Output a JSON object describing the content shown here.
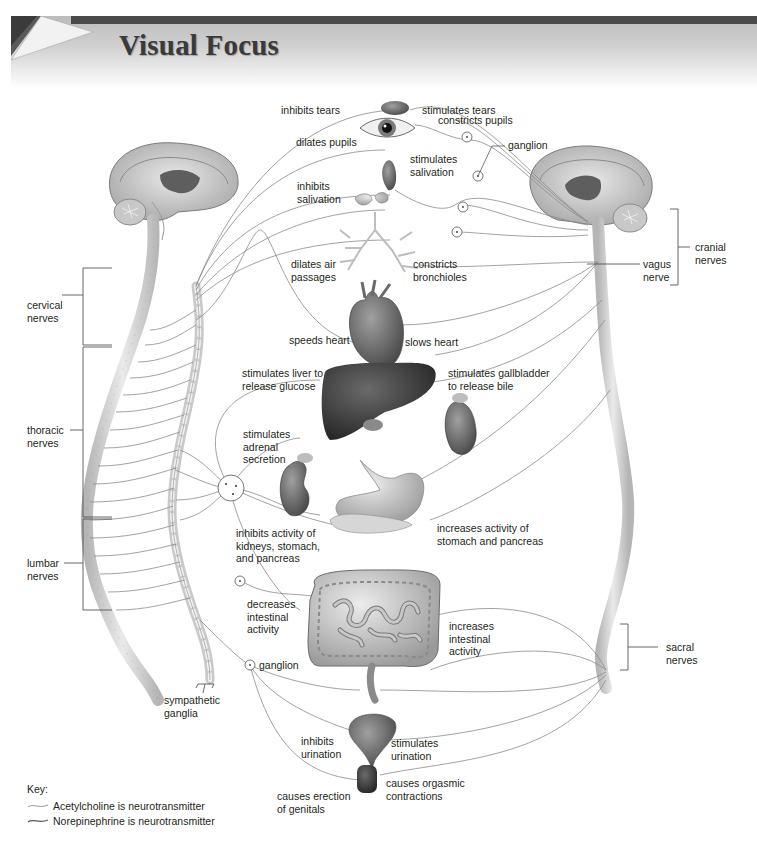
{
  "header": {
    "title": "Visual Focus"
  },
  "labels": {
    "inhibits_tears": "inhibits tears",
    "stimulates_tears": "stimulates tears",
    "constricts_pupils": "constricts pupils",
    "dilates_pupils": "dilates pupils",
    "ganglion_top": "ganglion",
    "stimulates_salivation": [
      "stimulates",
      "salivation"
    ],
    "inhibits_salivation": [
      "inhibits",
      "salivation"
    ],
    "dilates_air_passages": [
      "dilates air",
      "passages"
    ],
    "constricts_bronchioles": [
      "constricts",
      "bronchioles"
    ],
    "speeds_heart": "speeds heart",
    "slows_heart": "slows heart",
    "stimulates_liver": [
      "stimulates liver to",
      "release glucose"
    ],
    "stimulates_gallbladder": [
      "stimulates gallbladder",
      "to release bile"
    ],
    "stimulates_adrenal": [
      "stimulates",
      "adrenal",
      "secretion"
    ],
    "inhibits_kidneys": [
      "inhibits activity of",
      "kidneys, stomach,",
      "and pancreas"
    ],
    "increases_stomach": [
      "increases activity of",
      "stomach and pancreas"
    ],
    "decreases_intestinal": [
      "decreases",
      "intestinal",
      "activity"
    ],
    "increases_intestinal": [
      "increases",
      "intestinal",
      "activity"
    ],
    "ganglion_bottom": "ganglion",
    "sympathetic_ganglia": [
      "sympathetic",
      "ganglia"
    ],
    "inhibits_urination": [
      "inhibits",
      "urination"
    ],
    "stimulates_urination": [
      "stimulates",
      "urination"
    ],
    "causes_erection": [
      "causes erection",
      "of genitals"
    ],
    "causes_orgasmic": [
      "causes orgasmic",
      "contractions"
    ],
    "cervical_nerves": [
      "cervical",
      "nerves"
    ],
    "thoracic_nerves": [
      "thoracic",
      "nerves"
    ],
    "lumbar_nerves": [
      "lumbar",
      "nerves"
    ],
    "cranial_nerves": [
      "cranial",
      "nerves"
    ],
    "vagus_nerve": [
      "vagus",
      "nerve"
    ],
    "sacral_nerves": [
      "sacral",
      "nerves"
    ]
  },
  "key": {
    "title": "Key:",
    "items": [
      {
        "label": "Acetylcholine is neurotransmitter",
        "line_color": "#9a9a9a"
      },
      {
        "label": "Norepinephrine is neurotransmitter",
        "line_color": "#6a6a6a"
      }
    ]
  },
  "colors": {
    "nerve_line": "#8a8a8a",
    "spine": "#d9d9d9",
    "organ_dark": "#3b3b3b",
    "organ_mid": "#7a7a7a",
    "organ_light": "#bdbdbd"
  }
}
